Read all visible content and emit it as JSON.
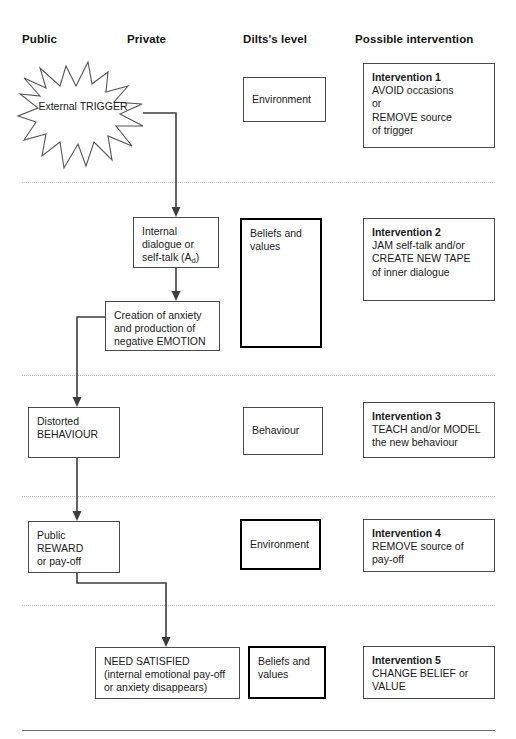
{
  "headers": [
    {
      "label": "Public"
    },
    {
      "label": "Private"
    },
    {
      "label": "Dilts's level"
    },
    {
      "label": "Possible intervention"
    }
  ],
  "trigger": {
    "line1": "External",
    "line2": "TRIGGER"
  },
  "rows": [
    {
      "dilts": {
        "label": "Environment"
      },
      "intervention": {
        "title": "Intervention 1",
        "lines": [
          "AVOID occasions",
          "or",
          "REMOVE source",
          "of trigger"
        ]
      }
    },
    {
      "private_a": {
        "line1": "Internal",
        "line2": "dialogue or",
        "line3_pre": "self-talk (A",
        "line3_sub": "d",
        "line3_post": ")"
      },
      "private_b": {
        "lines": [
          "Creation of anxiety",
          "and production of",
          "negative EMOTION"
        ]
      },
      "dilts": {
        "line1": "Beliefs and",
        "line2": "values"
      },
      "intervention": {
        "title": "Intervention 2",
        "lines": [
          "JAM self-talk and/or",
          "CREATE NEW TAPE",
          "of inner dialogue"
        ]
      }
    },
    {
      "public": {
        "line1": "Distorted",
        "line2": "BEHAVIOUR"
      },
      "dilts": {
        "label": "Behaviour"
      },
      "intervention": {
        "title": "Intervention 3",
        "lines": [
          "TEACH and/or MODEL",
          "the new behaviour"
        ]
      }
    },
    {
      "public": {
        "line1": "Public REWARD",
        "line2": "or pay-off"
      },
      "dilts": {
        "label": "Environment"
      },
      "intervention": {
        "title": "Intervention 4",
        "lines": [
          "REMOVE source of",
          "pay-off"
        ]
      }
    },
    {
      "private": {
        "lines": [
          "NEED SATISFIED",
          "(internal emotional pay-off",
          "or anxiety disappears)"
        ]
      },
      "dilts": {
        "line1": "Beliefs and",
        "line2": "values"
      },
      "intervention": {
        "title": "Intervention 5",
        "lines": [
          "CHANGE BELIEF or",
          "VALUE"
        ]
      }
    }
  ]
}
